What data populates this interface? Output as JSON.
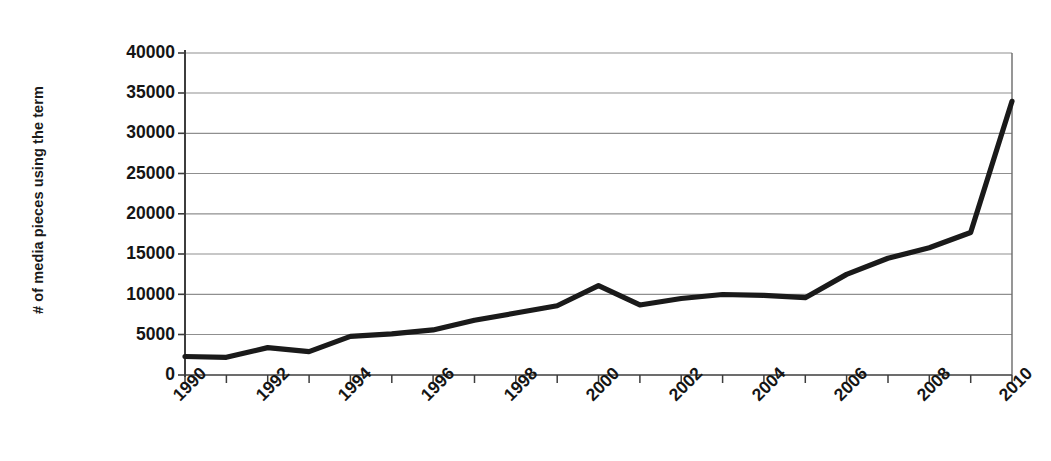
{
  "chart_data": {
    "type": "line",
    "title": "",
    "xlabel": "",
    "ylabel": "# of media pieces using the term",
    "x": [
      1990,
      1991,
      1992,
      1993,
      1994,
      1995,
      1996,
      1997,
      1998,
      1999,
      2000,
      2001,
      2002,
      2003,
      2004,
      2005,
      2006,
      2007,
      2008,
      2009,
      2010
    ],
    "values": [
      2300,
      2200,
      3400,
      2900,
      4800,
      5100,
      5600,
      6800,
      7700,
      8600,
      11100,
      8700,
      9500,
      10000,
      9900,
      9600,
      12500,
      14500,
      15800,
      17700,
      34000
    ],
    "series": [
      {
        "name": "# of media pieces using the term",
        "values": [
          2300,
          2200,
          3400,
          2900,
          4800,
          5100,
          5600,
          6800,
          7700,
          8600,
          11100,
          8700,
          9500,
          10000,
          9900,
          9600,
          12500,
          14500,
          15800,
          17700,
          34000
        ]
      }
    ],
    "xlim": [
      1990,
      2010
    ],
    "ylim": [
      0,
      40000
    ],
    "ytick_labels": [
      "0",
      "5000",
      "10000",
      "15000",
      "20000",
      "25000",
      "30000",
      "35000",
      "40000"
    ],
    "ytick_values": [
      0,
      5000,
      10000,
      15000,
      20000,
      25000,
      30000,
      35000,
      40000
    ],
    "xtick_labels": [
      "1990",
      "1992",
      "1994",
      "1996",
      "1998",
      "2000",
      "2002",
      "2004",
      "2006",
      "2008",
      "2010"
    ],
    "xtick_values": [
      1990,
      1992,
      1994,
      1996,
      1998,
      2000,
      2002,
      2004,
      2006,
      2008,
      2010
    ],
    "grid": "horizontal",
    "legend": "none",
    "line_color": "#1a1a1a",
    "grid_color": "#9a9a9a",
    "axis_color": "#4d4d4d",
    "background_color": "#ffffff"
  }
}
